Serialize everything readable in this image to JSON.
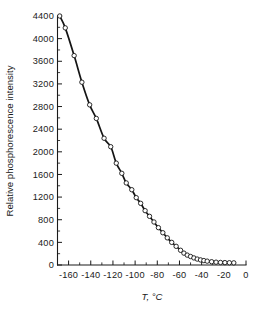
{
  "chart_data": {
    "type": "line",
    "title": "",
    "xlabel": "T, °C",
    "ylabel": "Relative phosphorescence intensity",
    "xlim": [
      -170,
      0
    ],
    "ylim": [
      0,
      4400
    ],
    "xticks": [
      -160,
      -140,
      -120,
      -100,
      -80,
      -60,
      -40,
      -20,
      0
    ],
    "xtick_labels": [
      "-160",
      "-140",
      "-120",
      "-100",
      "-80",
      "-60",
      "-40",
      "-20",
      "0"
    ],
    "x_minor_step": 10,
    "yticks": [
      0,
      400,
      800,
      1200,
      1600,
      2000,
      2400,
      2800,
      3200,
      3600,
      4000,
      4400
    ],
    "ytick_labels": [
      "0",
      "400",
      "800",
      "1200",
      "1600",
      "2000",
      "2400",
      "2800",
      "3200",
      "3600",
      "4000",
      "4400"
    ],
    "y_minor_step": 200,
    "grid": false,
    "legend": false,
    "marker": "open-circle",
    "line_color": "#141414",
    "marker_face_color": "#ffffff",
    "series": [
      {
        "name": "Relative phosphorescence intensity vs temperature",
        "x": [
          -168,
          -163,
          -155,
          -148,
          -141,
          -135,
          -128,
          -122,
          -117,
          -112,
          -108,
          -103,
          -99,
          -95,
          -91,
          -87,
          -83,
          -79,
          -75,
          -71,
          -67,
          -63,
          -59,
          -56,
          -53,
          -50,
          -47,
          -44,
          -41,
          -38,
          -35,
          -31,
          -27,
          -23,
          -19,
          -15,
          -11
        ],
        "y": [
          4400,
          4190,
          3700,
          3230,
          2830,
          2590,
          2240,
          2090,
          1800,
          1620,
          1450,
          1330,
          1190,
          1090,
          960,
          860,
          760,
          660,
          570,
          480,
          400,
          330,
          260,
          210,
          175,
          150,
          125,
          105,
          90,
          78,
          68,
          58,
          50,
          45,
          42,
          40,
          38
        ]
      }
    ],
    "annotations": []
  },
  "figure": {
    "background_color": "#ffffff",
    "axis_color": "#1a1a1a"
  }
}
